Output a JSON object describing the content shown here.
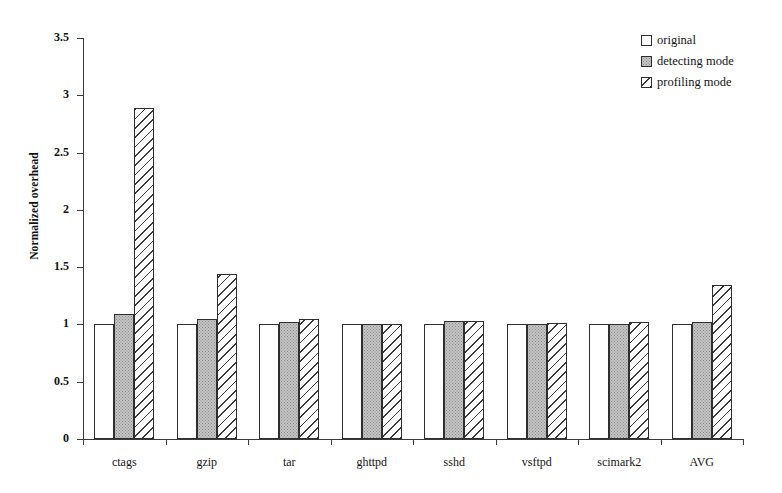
{
  "chart_data": {
    "type": "bar",
    "title": "",
    "xlabel": "",
    "ylabel": "Normalized overhead",
    "ylim": [
      0,
      3.5
    ],
    "ytick_labels": [
      "0",
      "0.5",
      "1",
      "1.5",
      "2",
      "2.5",
      "3",
      "3.5"
    ],
    "ytick_values": [
      0,
      0.5,
      1,
      1.5,
      2,
      2.5,
      3,
      3.5
    ],
    "grid": false,
    "legend_position": "top-right",
    "categories": [
      "ctags",
      "gzip",
      "tar",
      "ghttpd",
      "sshd",
      "vsftpd",
      "scimark2",
      "AVG"
    ],
    "series": [
      {
        "name": "original",
        "fill": "empty",
        "values": [
          1.0,
          1.0,
          1.0,
          1.0,
          1.0,
          1.0,
          1.0,
          1.0
        ]
      },
      {
        "name": "detecting mode",
        "fill": "gray-dotted",
        "values": [
          1.09,
          1.05,
          1.02,
          1.0,
          1.03,
          1.0,
          1.0,
          1.02
        ]
      },
      {
        "name": "profiling mode",
        "fill": "diagonal-hatch",
        "values": [
          2.89,
          1.44,
          1.05,
          1.0,
          1.03,
          1.01,
          1.02,
          1.34
        ]
      }
    ]
  },
  "legend": {
    "items": [
      {
        "label": "original",
        "fill": "empty"
      },
      {
        "label": "detecting mode",
        "fill": "gray-dotted"
      },
      {
        "label": "profiling mode",
        "fill": "diagonal-hatch"
      }
    ]
  },
  "colors": {
    "axis": "#3a3a3a",
    "bar_outline": "#2e2e2e",
    "original_fill": "#ffffff",
    "detecting_fill": "#c4c4c4",
    "profiling_fill": "#ffffff",
    "hatch_stroke": "#3a3a3a",
    "text": "#141414"
  }
}
